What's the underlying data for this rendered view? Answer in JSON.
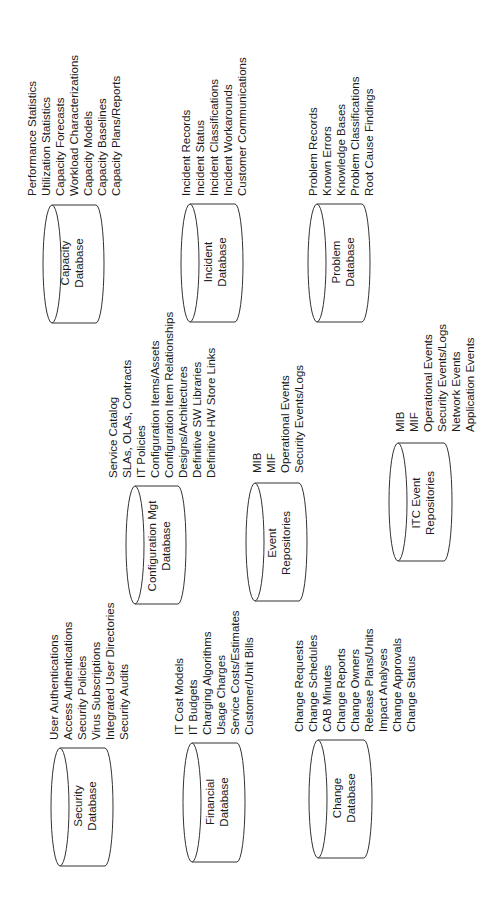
{
  "databases": [
    {
      "id": "capacity",
      "label_lines": [
        "Capacity",
        "Database"
      ],
      "items": [
        "Performance Statistics",
        "Utilization Statistics",
        "Capacity Forecasts",
        "Workload Characterizations",
        "Capacity Models",
        "Capacity Baselines",
        "Capacity Plans/Reports"
      ]
    },
    {
      "id": "incident",
      "label_lines": [
        "Incident",
        "Database"
      ],
      "items": [
        "Incident Records",
        "Incident Status",
        "Incident Classifications",
        "Incident Workarounds",
        "Customer Communications"
      ]
    },
    {
      "id": "problem",
      "label_lines": [
        "Problem",
        "Database"
      ],
      "items": [
        "Problem Records",
        "Known Errors",
        "Knowledge Bases",
        "Problem Classifications",
        "Root Cause Findings"
      ]
    },
    {
      "id": "configuration",
      "label_lines": [
        "Configuration Mgt",
        "Database"
      ],
      "items": [
        "Service Catalog",
        "SLAs, OLAs, Contracts",
        "IT Policies",
        "Configuration Items/Assets",
        "Configuration Item Relationships",
        "Designs/Architectures",
        "Definitive SW Libraries",
        "Definitive HW Store Links"
      ]
    },
    {
      "id": "event",
      "label_lines": [
        "Event",
        "Repositories"
      ],
      "items": [
        "MIB",
        "MIF",
        "Operational Events",
        "Security Events/Logs"
      ]
    },
    {
      "id": "itc-event",
      "label_lines": [
        "ITC Event",
        "Repositories"
      ],
      "items": [
        "MIB",
        "MIF",
        "Operational Events",
        "Security Events/Logs",
        "Network Events",
        "Application Events"
      ]
    },
    {
      "id": "security",
      "label_lines": [
        "Security",
        "Database"
      ],
      "items": [
        "User Authentications",
        "Access Authentications",
        "Security Policies",
        "Virus Subscriptions",
        "Integrated User Directories",
        "Security Audits"
      ]
    },
    {
      "id": "financial",
      "label_lines": [
        "Financial",
        "Database"
      ],
      "items": [
        "IT Cost Models",
        "IT Budgets",
        "Charging Algorithms",
        "Usage Charges",
        "Service Costs/Estimates",
        "Customer/Unit Bills"
      ]
    },
    {
      "id": "change",
      "label_lines": [
        "Change",
        "Database"
      ],
      "items": [
        "Change Requests",
        "Change Schedules",
        "CAB Minutes",
        "Change Reports",
        "Change Owners",
        "Release Plans/Units",
        "Impact Analyses",
        "Change Approvals",
        "Change Status"
      ]
    }
  ],
  "colors": {
    "stroke": "#333333",
    "text": "#1a1a1a",
    "background": "#ffffff"
  }
}
